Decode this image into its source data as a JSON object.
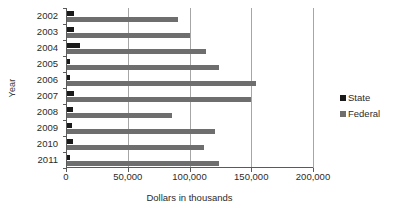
{
  "chart_data": {
    "type": "bar",
    "orientation": "horizontal",
    "title": "",
    "xlabel": "Dollars in thousands",
    "ylabel": "Year",
    "categories": [
      "2002",
      "2003",
      "2004",
      "2005",
      "2006",
      "2007",
      "2008",
      "2009",
      "2010",
      "2011"
    ],
    "series": [
      {
        "name": "State",
        "color": "#1a1a1a",
        "values": [
          6500,
          6800,
          11500,
          3200,
          3000,
          6500,
          6000,
          4500,
          5500,
          3000
        ]
      },
      {
        "name": "Federal",
        "color": "#6e6e6e",
        "values": [
          91000,
          100000,
          113000,
          124000,
          154000,
          150000,
          86000,
          121000,
          112000,
          124000
        ]
      }
    ],
    "xlim": [
      0,
      200000
    ],
    "xticks": [
      0,
      50000,
      100000,
      150000,
      200000
    ],
    "xtick_labels": [
      "0",
      "50,000",
      "100,000",
      "150,000",
      "200,000"
    ],
    "grid": "vertical",
    "legend_position": "right"
  },
  "legend": {
    "items": [
      {
        "label": "State",
        "color": "#1a1a1a"
      },
      {
        "label": "Federal",
        "color": "#6e6e6e"
      }
    ]
  }
}
